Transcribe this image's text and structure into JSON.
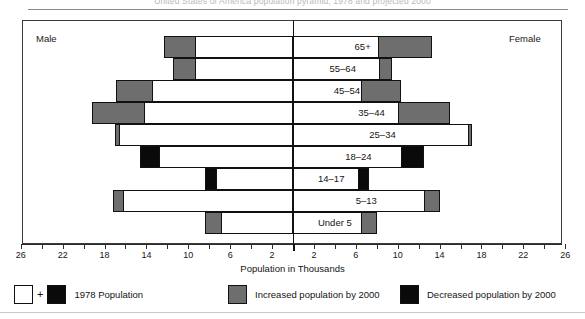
{
  "title_faint": "United States of America population pyramid, 1978 and projected 2000",
  "frame": {
    "male_label": "Male",
    "female_label": "Female"
  },
  "axis": {
    "title": "Population in Thousands",
    "tick_labels_left": [
      "26",
      "22",
      "18",
      "14",
      "10",
      "6",
      "2"
    ],
    "tick_labels_right": [
      "2",
      "6",
      "10",
      "14",
      "18",
      "22",
      "26"
    ],
    "unit_step": 2,
    "max": 28
  },
  "legend": {
    "items": [
      {
        "key": "base",
        "label": "1978 Population",
        "swatches": [
          "white",
          "black"
        ],
        "joiner": "+"
      },
      {
        "key": "increase",
        "label": "Increased population by 2000",
        "swatches": [
          "gray"
        ],
        "color": "#6e6e6e"
      },
      {
        "key": "decrease",
        "label": "Decreased population by 2000",
        "swatches": [
          "black"
        ],
        "color": "#0a0a0a"
      }
    ]
  },
  "chart_data": {
    "type": "bar",
    "subtype": "population-pyramid",
    "title": "United States of America population pyramid, 1978 and projected 2000",
    "xlabel": "Population in Thousands",
    "ylabel": "",
    "xlim": [
      -28,
      28
    ],
    "grid": false,
    "legend_position": "bottom",
    "categories": [
      "65+",
      "55–64",
      "45–54",
      "35–44",
      "25–34",
      "18–24",
      "14–17",
      "5–13",
      "Under 5"
    ],
    "series": [
      {
        "name": "Male 1978 Population",
        "side": "left",
        "values": [
          12.3,
          11.5,
          16.9,
          19.2,
          17.0,
          14.6,
          8.4,
          17.2,
          8.4
        ]
      },
      {
        "name": "Female 1978 Population",
        "side": "right",
        "values": [
          13.3,
          9.5,
          10.3,
          15.0,
          17.1,
          12.5,
          7.3,
          14.0,
          8.0
        ]
      },
      {
        "name": "Male Increased population by 2000",
        "side": "left",
        "values": [
          3.0,
          2.2,
          3.5,
          5.1,
          0.5,
          0.0,
          0.0,
          1.1,
          1.6
        ]
      },
      {
        "name": "Female Increased population by 2000",
        "side": "right",
        "values": [
          5.2,
          1.3,
          3.8,
          5.0,
          0.4,
          0.0,
          0.0,
          1.5,
          1.5
        ]
      },
      {
        "name": "Male Decreased population by 2000",
        "side": "left",
        "values": [
          0.0,
          0.0,
          0.0,
          0.0,
          0.0,
          1.9,
          1.1,
          0.0,
          0.0
        ]
      },
      {
        "name": "Female Decreased population by 2000",
        "side": "right",
        "values": [
          0.0,
          0.0,
          0.0,
          0.0,
          0.0,
          2.2,
          1.1,
          0.0,
          0.0
        ]
      }
    ],
    "rows": [
      {
        "category": "65+",
        "left": {
          "outer": 12.3,
          "increase": 3.0,
          "decrease": 0.0
        },
        "right": {
          "outer": 13.3,
          "increase": 5.2,
          "decrease": 0.0
        }
      },
      {
        "category": "55–64",
        "left": {
          "outer": 11.5,
          "increase": 2.2,
          "decrease": 0.0
        },
        "right": {
          "outer": 9.5,
          "increase": 1.3,
          "decrease": 0.0
        }
      },
      {
        "category": "45–54",
        "left": {
          "outer": 16.9,
          "increase": 3.5,
          "decrease": 0.0
        },
        "right": {
          "outer": 10.3,
          "increase": 3.8,
          "decrease": 0.0
        }
      },
      {
        "category": "35–44",
        "left": {
          "outer": 19.2,
          "increase": 5.1,
          "decrease": 0.0
        },
        "right": {
          "outer": 15.0,
          "increase": 5.0,
          "decrease": 0.0
        }
      },
      {
        "category": "25–34",
        "left": {
          "outer": 17.0,
          "increase": 0.5,
          "decrease": 0.0
        },
        "right": {
          "outer": 17.1,
          "increase": 0.4,
          "decrease": 0.0
        }
      },
      {
        "category": "18–24",
        "left": {
          "outer": 14.6,
          "increase": 0.0,
          "decrease": 1.9
        },
        "right": {
          "outer": 12.5,
          "increase": 0.0,
          "decrease": 2.2
        }
      },
      {
        "category": "14–17",
        "left": {
          "outer": 8.4,
          "increase": 0.0,
          "decrease": 1.1
        },
        "right": {
          "outer": 7.3,
          "increase": 0.0,
          "decrease": 1.1
        }
      },
      {
        "category": "5–13",
        "left": {
          "outer": 17.2,
          "increase": 1.1,
          "decrease": 0.0
        },
        "right": {
          "outer": 14.0,
          "increase": 1.5,
          "decrease": 0.0
        }
      },
      {
        "category": "Under 5",
        "left": {
          "outer": 8.4,
          "increase": 1.6,
          "decrease": 0.0
        },
        "right": {
          "outer": 8.0,
          "increase": 1.5,
          "decrease": 0.0
        }
      }
    ]
  }
}
